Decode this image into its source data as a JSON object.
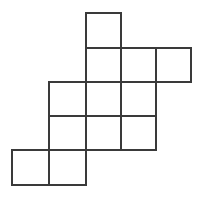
{
  "diagram": {
    "type": "cube-net-grid",
    "stroke_color": "#3a3a3a",
    "cell_size": 37,
    "x_edges": [
      12,
      49,
      86,
      121,
      156,
      191
    ],
    "y_edges": [
      13,
      48,
      82,
      116,
      150,
      185
    ],
    "cells": [
      {
        "col": 2,
        "row": 0
      },
      {
        "col": 2,
        "row": 1
      },
      {
        "col": 3,
        "row": 1
      },
      {
        "col": 4,
        "row": 1
      },
      {
        "col": 1,
        "row": 2
      },
      {
        "col": 2,
        "row": 2
      },
      {
        "col": 3,
        "row": 2
      },
      {
        "col": 1,
        "row": 3
      },
      {
        "col": 2,
        "row": 3
      },
      {
        "col": 3,
        "row": 3
      },
      {
        "col": 0,
        "row": 4
      },
      {
        "col": 1,
        "row": 4
      }
    ]
  }
}
